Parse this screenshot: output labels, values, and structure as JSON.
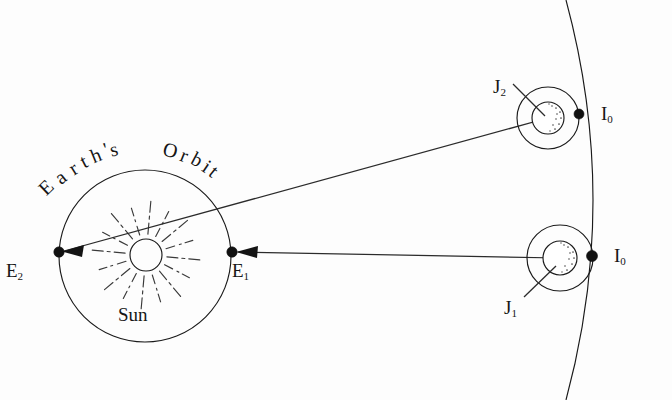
{
  "figure": {
    "background_color": "#fdfdfd",
    "ink_color": "#1a1a1a"
  },
  "labels": {
    "earths": "Earth's",
    "orbit": "Orbit",
    "sun": "Sun",
    "earth_pos_2": "E",
    "earth_pos_2_sub": "2",
    "earth_pos_1": "E",
    "earth_pos_1_sub": "1",
    "jupiter_pos_2": "J",
    "jupiter_pos_2_sub": "2",
    "jupiter_pos_1": "J",
    "jupiter_pos_1_sub": "1",
    "io_upper": "I",
    "io_upper_sub": "0",
    "io_lower": "I",
    "io_lower_sub": "0"
  },
  "geometry": {
    "earth_orbit": {
      "cx": 145,
      "cy": 256,
      "r": 86
    },
    "sun": {
      "cx": 146,
      "cy": 255,
      "r": 16
    },
    "earth_e2": {
      "cx": 59,
      "cy": 252
    },
    "earth_e1": {
      "cx": 232,
      "cy": 252
    },
    "jupiter_upper": {
      "cx": 548,
      "cy": 118,
      "body_r": 16,
      "io_orbit_r": 31
    },
    "jupiter_lower": {
      "cx": 560,
      "cy": 258,
      "body_r": 17,
      "io_orbit_r": 33
    },
    "io_upper": {
      "cx": 580,
      "cy": 114,
      "r": 5
    },
    "io_lower": {
      "cx": 592,
      "cy": 256,
      "r": 5.5
    },
    "ray_j2_to_e2": {
      "x1": 548,
      "y1": 118,
      "x2": 59,
      "y2": 252
    },
    "ray_j1_to_e1": {
      "x1": 560,
      "y1": 258,
      "x2": 232,
      "y2": 252
    },
    "jupiter_orbit_arc": {
      "start": [
        566,
        0
      ],
      "control": [
        618,
        200
      ],
      "end": [
        566,
        400
      ]
    },
    "sun_ray_count": 16
  },
  "arc_text": {
    "earths_letters": [
      {
        "ch": "E",
        "x": 40,
        "y": 176,
        "rot": -44
      },
      {
        "ch": "a",
        "x": 56,
        "y": 166,
        "rot": -38
      },
      {
        "ch": "r",
        "x": 70,
        "y": 157,
        "rot": -32
      },
      {
        "ch": "t",
        "x": 81,
        "y": 150,
        "rot": -27
      },
      {
        "ch": "h",
        "x": 91,
        "y": 144,
        "rot": -22
      },
      {
        "ch": "'",
        "x": 104,
        "y": 138,
        "rot": -17
      },
      {
        "ch": "s",
        "x": 110,
        "y": 138,
        "rot": -13
      }
    ],
    "orbit_letters": [
      {
        "ch": "O",
        "x": 163,
        "y": 139,
        "rot": 14
      },
      {
        "ch": "r",
        "x": 181,
        "y": 144,
        "rot": 22
      },
      {
        "ch": "b",
        "x": 192,
        "y": 148,
        "rot": 28
      },
      {
        "ch": "i",
        "x": 204,
        "y": 155,
        "rot": 34
      },
      {
        "ch": "t",
        "x": 211,
        "y": 160,
        "rot": 39
      }
    ]
  }
}
